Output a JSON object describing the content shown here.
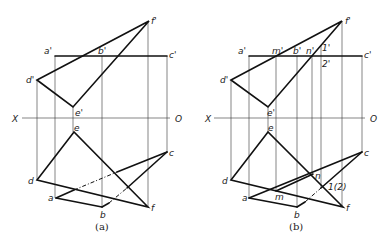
{
  "figure": {
    "panels": [
      {
        "id": "a",
        "caption": "(a)",
        "axis": {
          "left_label": "X",
          "right_label": "O"
        },
        "front_labels": {
          "a": "a'",
          "b": "b'",
          "c": "c'",
          "d": "d'",
          "e": "e'",
          "f": "f'"
        },
        "top_labels": {
          "a": "a",
          "b": "b",
          "c": "c",
          "d": "d",
          "e": "e",
          "f": "f"
        }
      },
      {
        "id": "b",
        "caption": "(b)",
        "axis": {
          "left_label": "X",
          "right_label": "O"
        },
        "front_labels": {
          "a": "a'",
          "b": "b'",
          "c": "c'",
          "d": "d'",
          "e": "e'",
          "f": "f'",
          "m": "m'",
          "n": "n'",
          "p1": "1'",
          "p2": "2'"
        },
        "top_labels": {
          "a": "a",
          "b": "b",
          "c": "c",
          "d": "d",
          "e": "e",
          "f": "f",
          "m": "m",
          "n": "n",
          "p12": "1(2)"
        }
      }
    ]
  }
}
